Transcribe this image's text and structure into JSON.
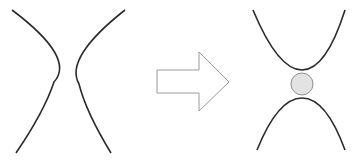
{
  "diagram": {
    "colors": {
      "curve_stroke": "#2b2b2b",
      "arrow_stroke": "#9a9a9a",
      "arrow_fill": "#ffffff",
      "circle_fill": "#e3e3e3",
      "circle_stroke": "#8f8f8f",
      "background": "#ffffff"
    },
    "before": {
      "label": "",
      "shape": "left-right hyperbola branches"
    },
    "arrow": {
      "direction": "right"
    },
    "after": {
      "label": "",
      "shape": "up-down hyperbola branches with circle"
    }
  }
}
